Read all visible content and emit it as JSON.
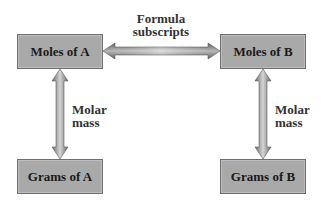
{
  "diagram": {
    "nodes": [
      {
        "id": "moles_a",
        "label": "Moles of A"
      },
      {
        "id": "moles_b",
        "label": "Moles of B"
      },
      {
        "id": "grams_a",
        "label": "Grams of A"
      },
      {
        "id": "grams_b",
        "label": "Grams of B"
      }
    ],
    "edges": [
      {
        "from": "moles_a",
        "to": "moles_b",
        "label_line1": "Formula",
        "label_line2": "subscripts",
        "bidirectional": true
      },
      {
        "from": "moles_a",
        "to": "grams_a",
        "label_line1": "Molar",
        "label_line2": "mass",
        "bidirectional": true
      },
      {
        "from": "moles_b",
        "to": "grams_b",
        "label_line1": "Molar",
        "label_line2": "mass",
        "bidirectional": true
      }
    ],
    "colors": {
      "box_fill": "#a9a9a9",
      "box_border": "#6e6e6e",
      "arrow_dark": "#6a6a6a",
      "arrow_light": "#d8d8d8"
    }
  }
}
